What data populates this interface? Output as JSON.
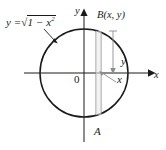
{
  "figure": {
    "labels": {
      "equation_lhs": "y =",
      "equation_radical": "√",
      "equation_radicand_prefix": "1 − x",
      "equation_radicand_exponent": "2",
      "point_B": "B(x, y)",
      "point_A": "A",
      "segment_y": "y",
      "segment_x": "x",
      "origin": "0",
      "axis_x": "x",
      "axis_y": "y"
    },
    "colors": {
      "stroke": "#1a1a1a",
      "strip": "#9a9a9a",
      "background": "#ffffff",
      "text": "#1a1a1a"
    },
    "geometry": {
      "center_x": 84,
      "center_y": 73,
      "radius": 44,
      "strip_left_x": 96,
      "strip_right_x": 101,
      "axis_x_start": 24,
      "axis_x_end": 152,
      "axis_y_top": 12,
      "axis_y_bottom": 142
    }
  }
}
